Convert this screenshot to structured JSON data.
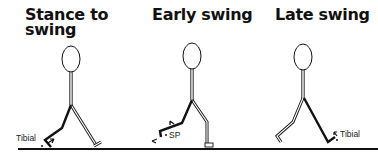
{
  "panels": [
    {
      "title_line1": "Stance to",
      "title_line2": "swing",
      "label": "Tibial"
    },
    {
      "title_line1": "Early swing",
      "title_line2": "",
      "label": "SP"
    },
    {
      "title_line1": "Late swing",
      "title_line2": "",
      "label": "Tibial"
    }
  ],
  "colors": {
    "ink": "#111111",
    "background": "#ffffff"
  }
}
